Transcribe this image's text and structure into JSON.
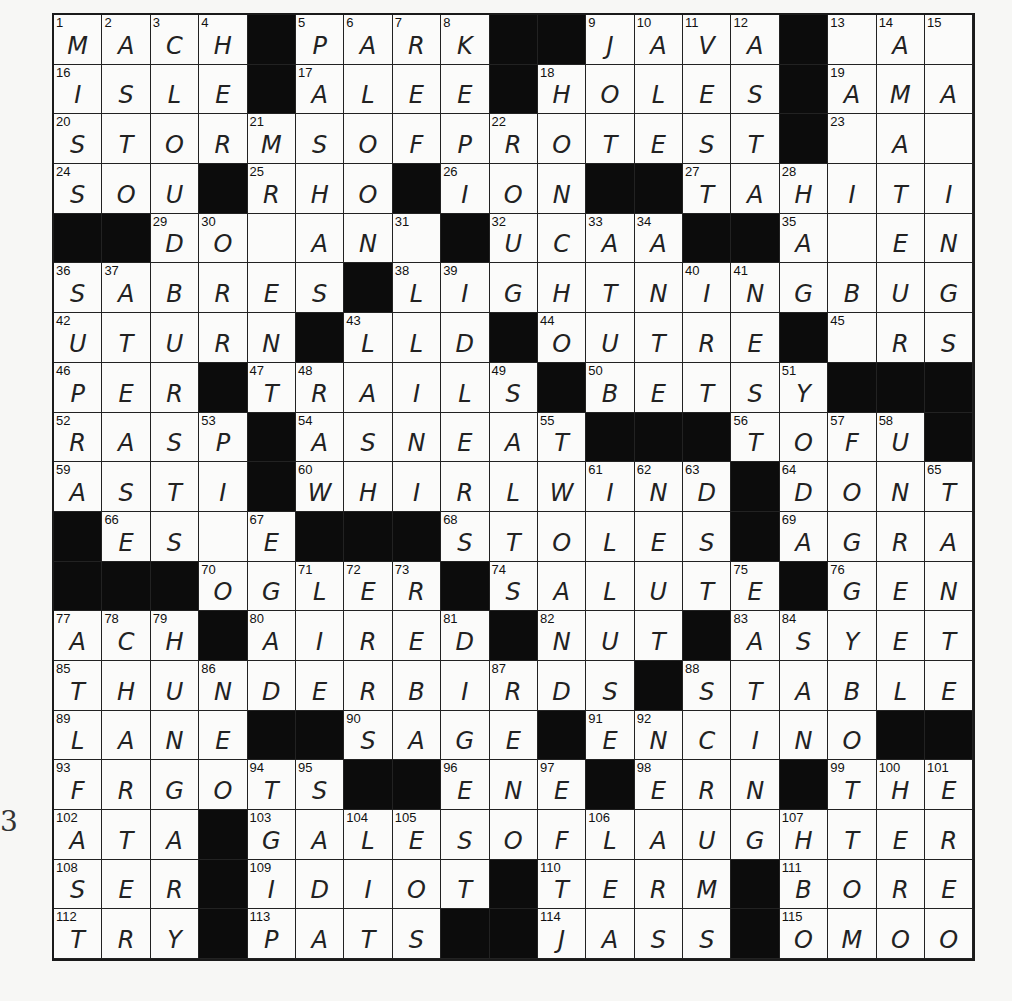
{
  "puzzle": {
    "rows": 19,
    "cols": 19,
    "grid": [
      "MACH#PARK##JAVA#.A.",
      "ISLE#ALEE#HOLES#AMA",
      "STORMSOFPROTEST#.A.",
      "SOU#RHO#ION##TAHITI",
      "##DO.AN.#UCAA##A.EN",
      "SABRES#LIGHTNINGBUG",
      "UTURN#LLD#OUTRE#.RS",
      "PER#TRAILS#BETSY###",
      "RASP#ASNEAT###TOFU#",
      "ASTI#WHIRLWIND#DONT",
      "#ES.E###STOLES#AGRA",
      "###OGLER#SALUTE#GEN",
      "ACH#AIRED#NUT#ASYET",
      "THUNDERBIRDS#STABLE",
      "LANE##SAGE#ENCINO##",
      "FRGOTS##ENE#ERN#THE",
      "ATA#GALESOFLAUGHTER",
      "SER#IDIOT#TERM#BORE",
      "TRY#PATS##JASS#OMOO"
    ],
    "numbers": [
      {
        "r": 0,
        "c": 0,
        "n": 1
      },
      {
        "r": 0,
        "c": 1,
        "n": 2
      },
      {
        "r": 0,
        "c": 2,
        "n": 3
      },
      {
        "r": 0,
        "c": 3,
        "n": 4
      },
      {
        "r": 0,
        "c": 5,
        "n": 5
      },
      {
        "r": 0,
        "c": 6,
        "n": 6
      },
      {
        "r": 0,
        "c": 7,
        "n": 7
      },
      {
        "r": 0,
        "c": 8,
        "n": 8
      },
      {
        "r": 0,
        "c": 11,
        "n": 9
      },
      {
        "r": 0,
        "c": 12,
        "n": 10
      },
      {
        "r": 0,
        "c": 13,
        "n": 11
      },
      {
        "r": 0,
        "c": 14,
        "n": 12
      },
      {
        "r": 0,
        "c": 16,
        "n": 13
      },
      {
        "r": 0,
        "c": 17,
        "n": 14
      },
      {
        "r": 0,
        "c": 18,
        "n": 15
      },
      {
        "r": 1,
        "c": 0,
        "n": 16
      },
      {
        "r": 1,
        "c": 5,
        "n": 17
      },
      {
        "r": 1,
        "c": 10,
        "n": 18
      },
      {
        "r": 1,
        "c": 16,
        "n": 19
      },
      {
        "r": 2,
        "c": 0,
        "n": 20
      },
      {
        "r": 2,
        "c": 4,
        "n": 21
      },
      {
        "r": 2,
        "c": 9,
        "n": 22
      },
      {
        "r": 2,
        "c": 16,
        "n": 23
      },
      {
        "r": 3,
        "c": 0,
        "n": 24
      },
      {
        "r": 3,
        "c": 4,
        "n": 25
      },
      {
        "r": 3,
        "c": 8,
        "n": 26
      },
      {
        "r": 3,
        "c": 13,
        "n": 27
      },
      {
        "r": 3,
        "c": 15,
        "n": 28
      },
      {
        "r": 4,
        "c": 2,
        "n": 29
      },
      {
        "r": 4,
        "c": 3,
        "n": 30
      },
      {
        "r": 4,
        "c": 7,
        "n": 31
      },
      {
        "r": 4,
        "c": 9,
        "n": 32
      },
      {
        "r": 4,
        "c": 11,
        "n": 33
      },
      {
        "r": 4,
        "c": 12,
        "n": 34
      },
      {
        "r": 4,
        "c": 15,
        "n": 35
      },
      {
        "r": 5,
        "c": 0,
        "n": 36
      },
      {
        "r": 5,
        "c": 1,
        "n": 37
      },
      {
        "r": 5,
        "c": 7,
        "n": 38
      },
      {
        "r": 5,
        "c": 8,
        "n": 39
      },
      {
        "r": 5,
        "c": 13,
        "n": 40
      },
      {
        "r": 5,
        "c": 14,
        "n": 41
      },
      {
        "r": 6,
        "c": 0,
        "n": 42
      },
      {
        "r": 6,
        "c": 6,
        "n": 43
      },
      {
        "r": 6,
        "c": 10,
        "n": 44
      },
      {
        "r": 6,
        "c": 16,
        "n": 45
      },
      {
        "r": 7,
        "c": 0,
        "n": 46
      },
      {
        "r": 7,
        "c": 4,
        "n": 47
      },
      {
        "r": 7,
        "c": 5,
        "n": 48
      },
      {
        "r": 7,
        "c": 9,
        "n": 49
      },
      {
        "r": 7,
        "c": 11,
        "n": 50
      },
      {
        "r": 7,
        "c": 15,
        "n": 51
      },
      {
        "r": 8,
        "c": 0,
        "n": 52
      },
      {
        "r": 8,
        "c": 3,
        "n": 53
      },
      {
        "r": 8,
        "c": 5,
        "n": 54
      },
      {
        "r": 8,
        "c": 10,
        "n": 55
      },
      {
        "r": 8,
        "c": 14,
        "n": 56
      },
      {
        "r": 8,
        "c": 16,
        "n": 57
      },
      {
        "r": 8,
        "c": 17,
        "n": 58
      },
      {
        "r": 9,
        "c": 0,
        "n": 59
      },
      {
        "r": 9,
        "c": 5,
        "n": 60
      },
      {
        "r": 9,
        "c": 11,
        "n": 61
      },
      {
        "r": 9,
        "c": 12,
        "n": 62
      },
      {
        "r": 9,
        "c": 13,
        "n": 63
      },
      {
        "r": 9,
        "c": 15,
        "n": 64
      },
      {
        "r": 9,
        "c": 18,
        "n": 65
      },
      {
        "r": 10,
        "c": 1,
        "n": 66
      },
      {
        "r": 10,
        "c": 4,
        "n": 67
      },
      {
        "r": 10,
        "c": 8,
        "n": 68
      },
      {
        "r": 10,
        "c": 15,
        "n": 69
      },
      {
        "r": 11,
        "c": 3,
        "n": 70
      },
      {
        "r": 11,
        "c": 5,
        "n": 71
      },
      {
        "r": 11,
        "c": 6,
        "n": 72
      },
      {
        "r": 11,
        "c": 7,
        "n": 73
      },
      {
        "r": 11,
        "c": 9,
        "n": 74
      },
      {
        "r": 11,
        "c": 14,
        "n": 75
      },
      {
        "r": 11,
        "c": 16,
        "n": 76
      },
      {
        "r": 12,
        "c": 0,
        "n": 77
      },
      {
        "r": 12,
        "c": 1,
        "n": 78
      },
      {
        "r": 12,
        "c": 2,
        "n": 79
      },
      {
        "r": 12,
        "c": 4,
        "n": 80
      },
      {
        "r": 12,
        "c": 8,
        "n": 81
      },
      {
        "r": 12,
        "c": 10,
        "n": 82
      },
      {
        "r": 12,
        "c": 14,
        "n": 83
      },
      {
        "r": 12,
        "c": 15,
        "n": 84
      },
      {
        "r": 13,
        "c": 0,
        "n": 85
      },
      {
        "r": 13,
        "c": 3,
        "n": 86
      },
      {
        "r": 13,
        "c": 9,
        "n": 87
      },
      {
        "r": 13,
        "c": 13,
        "n": 88
      },
      {
        "r": 14,
        "c": 0,
        "n": 89
      },
      {
        "r": 14,
        "c": 6,
        "n": 90
      },
      {
        "r": 14,
        "c": 11,
        "n": 91
      },
      {
        "r": 14,
        "c": 12,
        "n": 92
      },
      {
        "r": 15,
        "c": 0,
        "n": 93
      },
      {
        "r": 15,
        "c": 4,
        "n": 94
      },
      {
        "r": 15,
        "c": 5,
        "n": 95
      },
      {
        "r": 15,
        "c": 8,
        "n": 96
      },
      {
        "r": 15,
        "c": 10,
        "n": 97
      },
      {
        "r": 15,
        "c": 12,
        "n": 98
      },
      {
        "r": 15,
        "c": 16,
        "n": 99
      },
      {
        "r": 15,
        "c": 17,
        "n": 100
      },
      {
        "r": 15,
        "c": 18,
        "n": 101
      },
      {
        "r": 16,
        "c": 0,
        "n": 102
      },
      {
        "r": 16,
        "c": 4,
        "n": 103
      },
      {
        "r": 16,
        "c": 6,
        "n": 104
      },
      {
        "r": 16,
        "c": 7,
        "n": 105
      },
      {
        "r": 16,
        "c": 11,
        "n": 106
      },
      {
        "r": 16,
        "c": 15,
        "n": 107
      },
      {
        "r": 17,
        "c": 0,
        "n": 108
      },
      {
        "r": 17,
        "c": 4,
        "n": 109
      },
      {
        "r": 17,
        "c": 10,
        "n": 110
      },
      {
        "r": 17,
        "c": 15,
        "n": 111
      },
      {
        "r": 18,
        "c": 0,
        "n": 112
      },
      {
        "r": 18,
        "c": 4,
        "n": 113
      },
      {
        "r": 18,
        "c": 10,
        "n": 114
      },
      {
        "r": 18,
        "c": 15,
        "n": 115
      }
    ]
  },
  "margin_mark": "3",
  "colors": {
    "black_square": "#0c0c0c",
    "white_square": "#fbfbfa",
    "paper": "#f7f7f5",
    "ink": "#222222"
  }
}
